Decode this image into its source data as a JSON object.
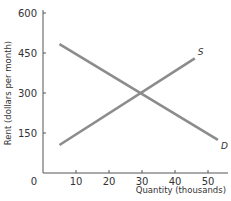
{
  "chart_data": {
    "type": "line",
    "title": "",
    "xlabel": "Quantity (thousands)",
    "ylabel": "Rent (dollars per month)",
    "xlim": [
      0,
      55
    ],
    "ylim": [
      0,
      600
    ],
    "x_ticks": [
      0,
      10,
      20,
      30,
      40,
      50
    ],
    "y_ticks": [
      150,
      300,
      450,
      600
    ],
    "grid": false,
    "legend": "none",
    "series": [
      {
        "name": "S",
        "label": "S",
        "points": [
          [
            5,
            105
          ],
          [
            46,
            430
          ]
        ]
      },
      {
        "name": "D",
        "label": "D",
        "points": [
          [
            5,
            483
          ],
          [
            53,
            124
          ]
        ]
      }
    ],
    "equilibrium": {
      "quantity": 30,
      "rent": 300
    },
    "colors": {
      "line": "#8c8c8c",
      "axis": "#555555",
      "text": "#333333"
    }
  }
}
